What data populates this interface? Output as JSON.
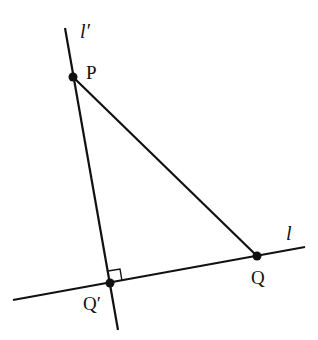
{
  "diagram": {
    "points": {
      "P": {
        "label": "P",
        "x": 73,
        "y": 77
      },
      "Q": {
        "label": "Q",
        "x": 257,
        "y": 256
      },
      "Qprime": {
        "label": "Q′",
        "x": 110,
        "y": 283
      }
    },
    "lines": {
      "l": {
        "label": "l",
        "x1": 13,
        "y1": 300,
        "x2": 305,
        "y2": 247
      },
      "lprime": {
        "label": "l′",
        "x1": 65,
        "y1": 28,
        "x2": 118,
        "y2": 330
      }
    },
    "segments": [
      {
        "from": "P",
        "to": "Q"
      }
    ],
    "right_angle_at": "Qprime",
    "stroke_color": "#111111"
  }
}
